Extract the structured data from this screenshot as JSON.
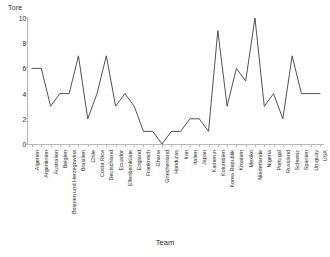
{
  "chart_data": {
    "type": "line",
    "title": "",
    "ylabel": "Tore",
    "xlabel": "Team",
    "ylim": [
      0,
      10
    ],
    "yticks": [
      0,
      2,
      4,
      6,
      8,
      10
    ],
    "grid": false,
    "legend": "none",
    "line_color": "#404040",
    "categories": [
      "Algerien",
      "Argentinien",
      "Australien",
      "Belgien",
      "Bosnien und Herzegowina",
      "Brasilien",
      "Chile",
      "Costa Rica",
      "Deutschland",
      "Ecuador",
      "Elfenbeinküste",
      "England",
      "Frankreich",
      "Ghana",
      "Griechenland",
      "Honduras",
      "Iran",
      "Italien",
      "Japan",
      "Kamerun",
      "Kolumbien",
      "Korea Republik",
      "Kroatien",
      "Mexiko",
      "Niederlande",
      "Nigeria",
      "Portugal",
      "Russland",
      "Schweiz",
      "Spanien",
      "Uruguay",
      "USA"
    ],
    "values": [
      6,
      6,
      3,
      4,
      4,
      7,
      2,
      4,
      7,
      3,
      4,
      3,
      1,
      1,
      0,
      1,
      1,
      2,
      2,
      1,
      9,
      3,
      6,
      5,
      10,
      3,
      4,
      2,
      7,
      4,
      4,
      4
    ]
  }
}
